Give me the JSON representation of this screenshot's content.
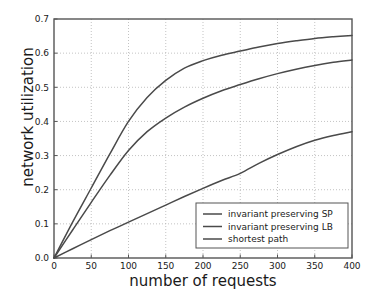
{
  "chart_data": {
    "type": "line",
    "title": "",
    "xlabel": "number of requests",
    "ylabel": "network utilization",
    "xlim": [
      0,
      400
    ],
    "ylim": [
      0.0,
      0.7
    ],
    "xticks": [
      0,
      50,
      100,
      150,
      200,
      250,
      300,
      350,
      400
    ],
    "xticklabels": [
      "0",
      "50",
      "100",
      "150",
      "200",
      "250",
      "300",
      "350",
      "400"
    ],
    "yticks": [
      0.0,
      0.1,
      0.2,
      0.3,
      0.4,
      0.5,
      0.6,
      0.7
    ],
    "yticklabels": [
      "0.0",
      "0.1",
      "0.2",
      "0.3",
      "0.4",
      "0.5",
      "0.6",
      "0.7"
    ],
    "grid": true,
    "grid_style": "dotted",
    "legend_position": "lower right",
    "x": [
      0,
      25,
      50,
      75,
      100,
      125,
      150,
      175,
      200,
      225,
      250,
      275,
      300,
      325,
      350,
      375,
      400
    ],
    "series": [
      {
        "name": "invariant preserving SP",
        "color": "#4a4a4a",
        "values": [
          0.0,
          0.105,
          0.205,
          0.305,
          0.4,
          0.47,
          0.52,
          0.556,
          0.578,
          0.594,
          0.606,
          0.618,
          0.628,
          0.636,
          0.643,
          0.648,
          0.652
        ]
      },
      {
        "name": "invariant preserving LB",
        "color": "#4a4a4a",
        "values": [
          0.0,
          0.082,
          0.163,
          0.242,
          0.315,
          0.37,
          0.41,
          0.442,
          0.468,
          0.49,
          0.508,
          0.525,
          0.54,
          0.553,
          0.564,
          0.573,
          0.58
        ]
      },
      {
        "name": "shortest path",
        "color": "#4a4a4a",
        "values": [
          0.0,
          0.027,
          0.054,
          0.08,
          0.105,
          0.13,
          0.155,
          0.18,
          0.204,
          0.227,
          0.248,
          0.277,
          0.303,
          0.326,
          0.345,
          0.359,
          0.37
        ]
      }
    ]
  },
  "legend": {
    "entries": [
      {
        "label": "invariant preserving SP"
      },
      {
        "label": "invariant preserving LB"
      },
      {
        "label": "shortest path"
      }
    ]
  },
  "axes": {
    "x_title": "number of requests",
    "y_title": "network utilization"
  },
  "colors": {
    "axis": "#555555",
    "grid": "#b4b4b4",
    "line": "#4a4a4a",
    "text": "#1a1a1a",
    "background": "#ffffff"
  }
}
